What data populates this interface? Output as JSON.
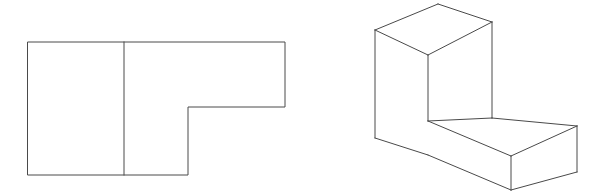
{
  "document": {
    "title": "Orthographic and Isometric Views of L-Shaped Block",
    "sheet_background": "#ffffff",
    "line_color": "#4a4a4a",
    "line_width": 1,
    "width": 612,
    "height": 196
  },
  "figures": [
    {
      "id": "orthographic-view",
      "name": "orthographic-top-view",
      "type": "2d-orthographic-projection",
      "description": "L-shaped outline with one internal vertical edge line dividing the left portion from the right portion",
      "outline_points": "28,42 285,42 285,107 188,107 188,175 28,175",
      "internal_lines": [
        {
          "name": "internal-vertical-edge",
          "points": "124,42 124,175"
        }
      ],
      "bounds": {
        "x": 28,
        "y": 42,
        "width": 257,
        "height": 133
      }
    },
    {
      "id": "isometric-view",
      "name": "isometric-pictorial-view",
      "type": "3d-isometric-projection",
      "description": "L-shaped solid block drawn in isometric projection, tall rectangular prism at rear left with a lower arm extending to the right front",
      "faces": [
        {
          "name": "top-face-upper-block",
          "points": "375,30 438,4 492,22 428,55"
        },
        {
          "name": "front-left-face-upper-block",
          "points": "375,30 428,55 428,121 375,138"
        },
        {
          "name": "front-right-face-upper-block",
          "points": "428,55 492,22 492,118 428,121"
        },
        {
          "name": "top-face-lower-arm",
          "points": "428,121 492,118 577,126 511,156"
        },
        {
          "name": "front-left-face-lower-arm",
          "points": "428,121 511,156 511,190 428,155"
        },
        {
          "name": "front-right-face-lower-arm",
          "points": "511,156 577,126 577,172 511,190"
        }
      ],
      "edges": [
        {
          "name": "top-rear-left-edge",
          "points": "375,30 438,4"
        },
        {
          "name": "top-rear-right-edge",
          "points": "438,4 492,22"
        },
        {
          "name": "top-front-right-edge",
          "points": "492,22 428,55"
        },
        {
          "name": "top-front-left-edge",
          "points": "428,55 375,30"
        },
        {
          "name": "vertical-edge-far-left",
          "points": "375,30 375,138"
        },
        {
          "name": "vertical-edge-upper-front-corner",
          "points": "428,55 428,121"
        },
        {
          "name": "vertical-edge-upper-right",
          "points": "492,22 492,118"
        },
        {
          "name": "step-top-edge-left",
          "points": "428,121 492,118"
        },
        {
          "name": "step-top-edge-right",
          "points": "492,118 577,126"
        },
        {
          "name": "arm-top-front-right-edge",
          "points": "577,126 511,156"
        },
        {
          "name": "arm-top-front-left-edge",
          "points": "511,156 428,121"
        },
        {
          "name": "vertical-edge-arm-front-corner",
          "points": "511,156 511,190"
        },
        {
          "name": "vertical-edge-arm-far-right",
          "points": "577,126 577,172"
        },
        {
          "name": "bottom-edge-left",
          "points": "375,138 428,155"
        },
        {
          "name": "bottom-edge-front-left",
          "points": "428,155 511,190"
        },
        {
          "name": "bottom-edge-front-right",
          "points": "511,190 577,172"
        }
      ],
      "bounds": {
        "x": 375,
        "y": 4,
        "width": 202,
        "height": 186
      }
    }
  ]
}
